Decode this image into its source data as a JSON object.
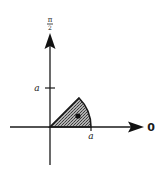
{
  "diagram": {
    "type": "polar-sector",
    "top_axis_label": {
      "numerator": "π",
      "denominator": "2"
    },
    "right_axis_label": "0",
    "vertical_tick_label": "a",
    "horizontal_tick_label": "a",
    "sector": {
      "start_angle_deg": 0,
      "end_angle_deg": 45,
      "radius_label": "a",
      "fill": "stippled-grey"
    },
    "centroid_dot": true
  },
  "colors": {
    "ink": "#1a1a1a",
    "fill": "#8a8a8a",
    "background": "#ffffff"
  }
}
